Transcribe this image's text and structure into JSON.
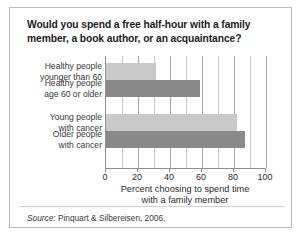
{
  "figure": {
    "title": "Would you spend a free half-hour with a family member, a book author, or an acquaintance?",
    "source_lead": "Source:",
    "source_text": " Pinquart & Silbereisen, 2006."
  },
  "colors": {
    "bar_light": "#c9c9c9",
    "bar_dark": "#8a8a8a",
    "axis": "#8e8e8e",
    "gridline": "#c6c6c6",
    "frame_border": "#b9b9b9",
    "text": "#2b2b2b"
  },
  "chart_data": {
    "type": "bar",
    "orientation": "horizontal",
    "title": "Would you spend a free half-hour with a family member, a book author, or an acquaintance?",
    "xlabel": "Percent choosing to spend time with a family member",
    "ylabel": "",
    "xlim": [
      0,
      100
    ],
    "xticks": [
      0,
      20,
      40,
      60,
      80,
      100
    ],
    "xtick_labels": [
      "0",
      "20",
      "40",
      "60",
      "80",
      "100"
    ],
    "minor_gridlines": [
      10,
      30,
      50,
      70,
      90
    ],
    "grid": true,
    "legend": false,
    "categories": [
      "Healthy people younger than 60",
      "Healthy people age 60 or older",
      "Young people with cancer",
      "Older people with cancer"
    ],
    "category_lines": [
      [
        "Healthy people",
        "younger than 60"
      ],
      [
        "Healthy people",
        "age 60 or older"
      ],
      [
        "Young people",
        "with cancer"
      ],
      [
        "Older people",
        "with cancer"
      ]
    ],
    "values": [
      31,
      59,
      82,
      87
    ],
    "bar_colors": [
      "#c9c9c9",
      "#8a8a8a",
      "#c9c9c9",
      "#8a8a8a"
    ],
    "group_gap_after_index": 1
  },
  "axis_title_lines": [
    "Percent choosing to spend time",
    "with a family member"
  ]
}
